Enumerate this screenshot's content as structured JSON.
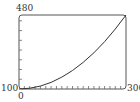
{
  "chart_data": {
    "type": "line",
    "title": "",
    "xlabel": "",
    "ylabel": "",
    "xlim": [
      0,
      300
    ],
    "ylim": [
      100,
      480
    ],
    "x_tick_labels": [
      "0",
      "300"
    ],
    "y_tick_labels": [
      "100",
      "480"
    ],
    "x_minor_tick_step": 15,
    "y_minor_tick_step": 50,
    "grid": false,
    "legend": null,
    "series": [
      {
        "name": "curve",
        "x": [
          0,
          30,
          60,
          90,
          120,
          150,
          180,
          210,
          240,
          270,
          300
        ],
        "y": [
          100,
          104,
          115,
          134,
          161,
          195,
          237,
          286,
          343,
          408,
          480
        ]
      }
    ]
  },
  "labels": {
    "y_max": "480",
    "y_min": "100",
    "x_min": "0",
    "x_max": "300"
  },
  "colors": {
    "frame": "#555555",
    "curve": "#333333",
    "text": "#333333"
  }
}
